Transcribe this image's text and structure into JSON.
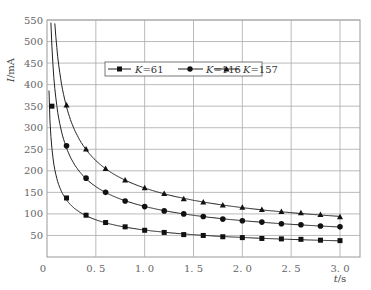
{
  "chart_data": {
    "type": "line",
    "title": "",
    "xlabel": "t/s",
    "ylabel": "I/mA",
    "xlim": [
      0,
      3.2
    ],
    "ylim": [
      0,
      550
    ],
    "x_ticks": [
      "0",
      "0.5",
      "1.0",
      "1.5",
      "2.0",
      "2.5",
      "3.0"
    ],
    "x_tick_values": [
      0,
      0.5,
      1.0,
      1.5,
      2.0,
      2.5,
      3.0
    ],
    "y_ticks": [
      50,
      100,
      150,
      200,
      250,
      300,
      350,
      400,
      450,
      500,
      550
    ],
    "grid": true,
    "legend_position": "upper center",
    "series": [
      {
        "name": "K=61",
        "marker": "square",
        "x": [
          0.05,
          0.2,
          0.4,
          0.6,
          0.8,
          1.0,
          1.2,
          1.4,
          1.6,
          1.8,
          2.0,
          2.2,
          2.4,
          2.6,
          2.8,
          3.0
        ],
        "values": [
          350,
          137,
          97,
          80,
          70,
          62,
          57,
          52,
          50,
          47,
          45,
          43,
          42,
          41,
          39,
          38
        ],
        "fit_k": 61
      },
      {
        "name": "K=116",
        "marker": "circle",
        "x": [
          0.2,
          0.4,
          0.6,
          0.8,
          1.0,
          1.2,
          1.4,
          1.6,
          1.8,
          2.0,
          2.2,
          2.4,
          2.6,
          2.8,
          3.0
        ],
        "values": [
          258,
          183,
          150,
          130,
          117,
          107,
          100,
          94,
          88,
          84,
          81,
          77,
          75,
          72,
          70
        ],
        "fit_k": 116
      },
      {
        "name": "K=157",
        "marker": "triangle",
        "x": [
          0.2,
          0.4,
          0.6,
          0.8,
          1.0,
          1.2,
          1.4,
          1.6,
          1.8,
          2.0,
          2.2,
          2.4,
          2.6,
          2.8,
          3.0
        ],
        "values": [
          352,
          250,
          205,
          178,
          160,
          147,
          135,
          127,
          120,
          115,
          110,
          105,
          102,
          98,
          93
        ],
        "fit_k": 157
      }
    ]
  },
  "legend": {
    "items": [
      {
        "k_label": "K",
        "value": "=61"
      },
      {
        "k_label": "K",
        "value": "=116"
      },
      {
        "k_label": "K",
        "value": "=157"
      }
    ]
  },
  "axis": {
    "y_label_i": "I",
    "y_label_unit": "/mA",
    "x_label_t": "t",
    "x_label_unit": "/s",
    "origin": "0"
  }
}
